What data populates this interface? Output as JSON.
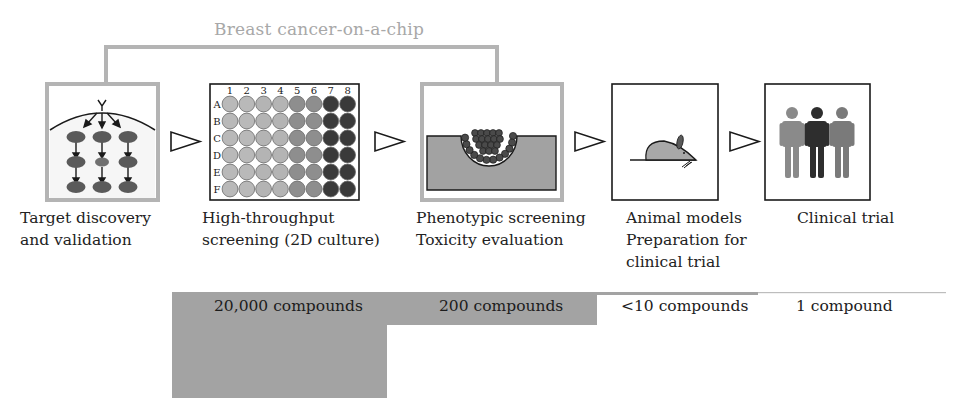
{
  "diagram": {
    "title": "Breast cancer-on-a-chip",
    "bracket_color": "#b4b4b4",
    "stages": [
      {
        "id": "target",
        "label_lines": [
          "Target discovery",
          "and validation"
        ],
        "icon": "signaling-pathway-icon",
        "border": "gray"
      },
      {
        "id": "hts",
        "label_lines": [
          "High-throughput",
          "screening (2D culture)"
        ],
        "icon": "well-plate-icon",
        "border": "black"
      },
      {
        "id": "phenotypic",
        "label_lines": [
          "Phenotypic screening",
          "Toxicity evaluation"
        ],
        "icon": "tumor-spheroid-icon",
        "border": "gray"
      },
      {
        "id": "animal",
        "label_lines": [
          "Animal models",
          "Preparation for",
          "clinical trial"
        ],
        "icon": "mouse-icon",
        "border": "black"
      },
      {
        "id": "clinical",
        "label_lines": [
          "Clinical trial"
        ],
        "icon": "people-icon",
        "border": "black"
      }
    ],
    "plate": {
      "columns": [
        "1",
        "2",
        "3",
        "4",
        "5",
        "6",
        "7",
        "8"
      ],
      "rows": [
        "A",
        "B",
        "C",
        "D",
        "E",
        "F"
      ],
      "column_colors": [
        "#b9b9b9",
        "#b9b9b9",
        "#b4b4b4",
        "#b4b4b4",
        "#8e8e8e",
        "#8e8e8e",
        "#3a3a3a",
        "#3a3a3a"
      ]
    },
    "people_colors": [
      "#8a8a8a",
      "#2e2e2e",
      "#7a7a7a"
    ],
    "funnel": {
      "fill": "#a3a3a3",
      "counts": [
        "20,000 compounds",
        "200 compounds",
        "<10 compounds",
        "1 compound"
      ]
    }
  }
}
